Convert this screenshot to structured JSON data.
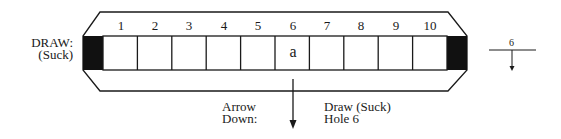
{
  "diagram": {
    "type": "harmonica-tablature",
    "left_label": {
      "line1": "DRAW:",
      "line2": "(Suck)"
    },
    "holes": [
      {
        "number": "1",
        "mark": ""
      },
      {
        "number": "2",
        "mark": ""
      },
      {
        "number": "3",
        "mark": ""
      },
      {
        "number": "4",
        "mark": ""
      },
      {
        "number": "5",
        "mark": ""
      },
      {
        "number": "6",
        "mark": "a"
      },
      {
        "number": "7",
        "mark": ""
      },
      {
        "number": "8",
        "mark": ""
      },
      {
        "number": "9",
        "mark": ""
      },
      {
        "number": "10",
        "mark": ""
      }
    ],
    "arrow_label": {
      "line1": "Arrow",
      "line2": "Down:"
    },
    "arrow_meaning": {
      "line1": "Draw (Suck)",
      "line2": "Hole 6"
    },
    "notation_symbol": {
      "number": "6",
      "direction": "down"
    },
    "colors": {
      "ink": "#1a1a1a",
      "background": "#ffffff"
    }
  }
}
